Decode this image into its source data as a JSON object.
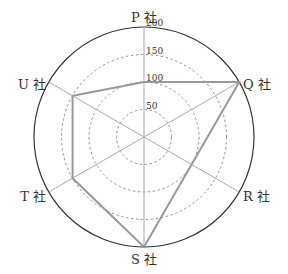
{
  "chart_data": {
    "type": "radar",
    "title": "",
    "categories": [
      "P社",
      "Q社",
      "R社",
      "S社",
      "T社",
      "U社"
    ],
    "series": [
      {
        "name": "",
        "values": [
          100,
          200,
          100,
          200,
          150,
          150
        ]
      }
    ],
    "rlim": [
      0,
      200
    ],
    "ticks": [
      50,
      100,
      150,
      200
    ],
    "tick_labels": [
      "50",
      "100",
      "150",
      "200"
    ],
    "grid": "dashed circles",
    "legend": "none"
  },
  "labels": {
    "P": "P 社",
    "Q": "Q 社",
    "R": "R 社",
    "S": "S 社",
    "T": "T 社",
    "U": "U 社"
  },
  "colors": {
    "series_line": "#999999",
    "axis": "#aaaaaa",
    "grid": "#777777",
    "outer": "#333333"
  }
}
